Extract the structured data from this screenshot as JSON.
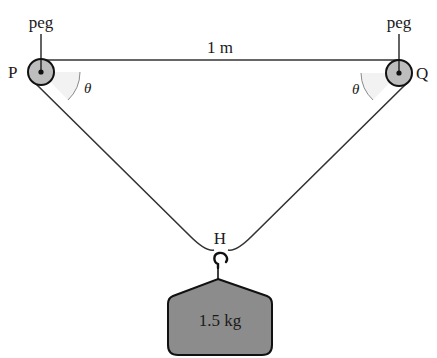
{
  "diagram": {
    "peg_left": {
      "label": "peg",
      "point_label": "P"
    },
    "peg_right": {
      "label": "peg",
      "point_label": "Q"
    },
    "distance_label": "1 m",
    "angle_left": "θ",
    "angle_right": "θ",
    "hook_point_label": "H",
    "mass_label": "1.5 kg",
    "colors": {
      "line": "#222222",
      "peg_fill": "#bdbdbd",
      "mass_fill": "#8c8c8c",
      "angle_arc": "#888888",
      "angle_fill": "#f0f0f0"
    }
  }
}
